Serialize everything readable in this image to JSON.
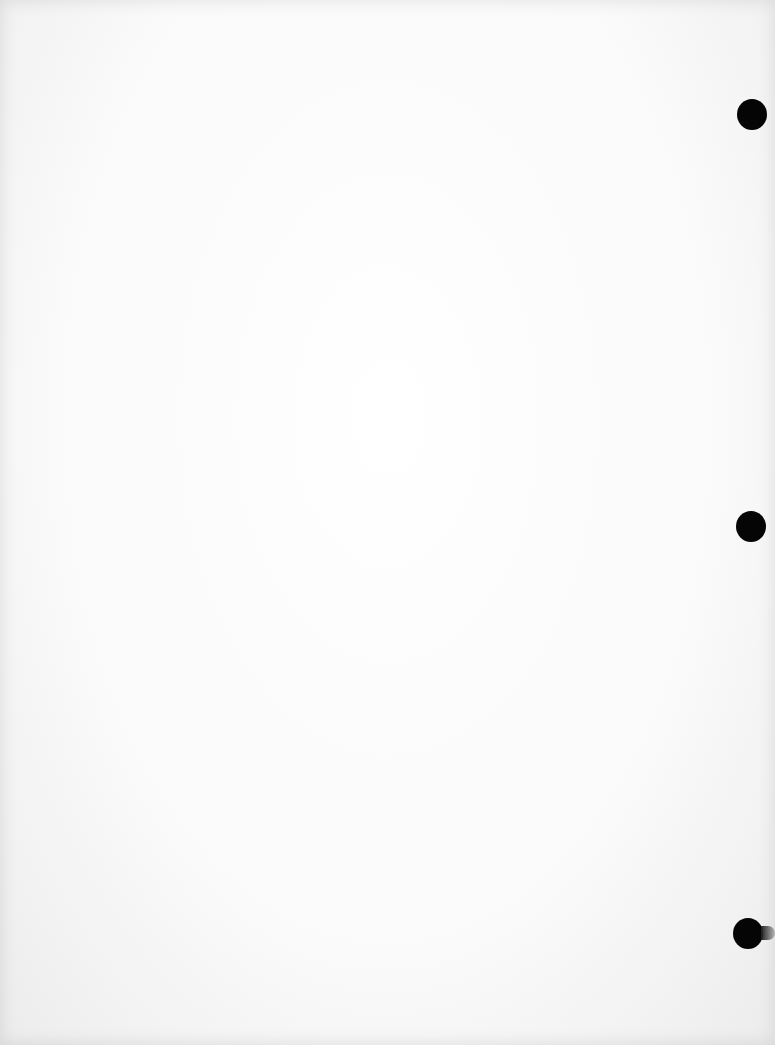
{
  "document": {
    "type": "blank scanned page",
    "background_color": "#fafafa",
    "hole_color": "#050505",
    "punch_holes": [
      {
        "name": "top",
        "cx": 752,
        "cy": 114
      },
      {
        "name": "middle",
        "cx": 751,
        "cy": 526
      },
      {
        "name": "bottom",
        "cx": 748,
        "cy": 933
      }
    ],
    "bleed_through_text": ""
  }
}
